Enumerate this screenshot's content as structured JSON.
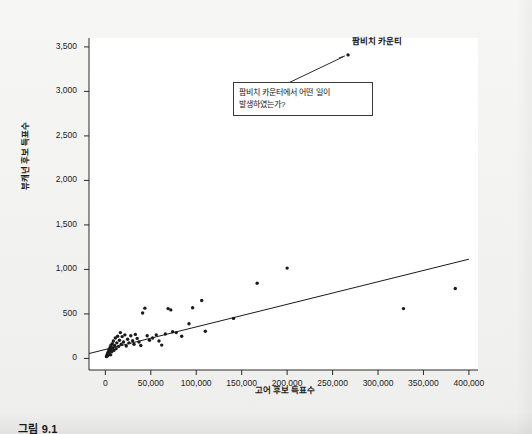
{
  "figure": {
    "caption": "그림 9.1"
  },
  "chart_data": {
    "type": "scatter",
    "title": "",
    "xlabel": "고어 후보 득표수",
    "ylabel": "뷰캐넌 후보 득표수",
    "xlim": [
      -18000,
      410000
    ],
    "ylim": [
      -130,
      3600
    ],
    "grid": false,
    "legend": "none",
    "x_ticks": [
      0,
      50000,
      100000,
      150000,
      200000,
      250000,
      300000,
      350000,
      400000
    ],
    "x_tick_labels": [
      "0",
      "50,000",
      "100,000",
      "150,000",
      "200,000",
      "250,000",
      "300,000",
      "350,000",
      "400,000"
    ],
    "y_ticks": [
      0,
      500,
      1000,
      1500,
      2000,
      2500,
      3000,
      3500
    ],
    "y_tick_labels": [
      "0",
      "500",
      "1,000",
      "1,500",
      "2,000",
      "2,500",
      "3,000",
      "3,500"
    ],
    "point_color": "#1a1a1a",
    "line_color": "#1a1a1a",
    "trend_line": {
      "name": "회귀선",
      "x0": -18000,
      "y0": 55,
      "x1": 400000,
      "y1": 1115
    },
    "points": [
      {
        "x": 1200,
        "y": 20
      },
      {
        "x": 1800,
        "y": 35
      },
      {
        "x": 2200,
        "y": 50
      },
      {
        "x": 2600,
        "y": 30
      },
      {
        "x": 3000,
        "y": 70
      },
      {
        "x": 3400,
        "y": 45
      },
      {
        "x": 3800,
        "y": 95
      },
      {
        "x": 4200,
        "y": 60
      },
      {
        "x": 4600,
        "y": 110
      },
      {
        "x": 5000,
        "y": 85
      },
      {
        "x": 5400,
        "y": 130
      },
      {
        "x": 5800,
        "y": 40
      },
      {
        "x": 6200,
        "y": 150
      },
      {
        "x": 6600,
        "y": 105
      },
      {
        "x": 7000,
        "y": 75
      },
      {
        "x": 7600,
        "y": 165
      },
      {
        "x": 8200,
        "y": 120
      },
      {
        "x": 8800,
        "y": 195
      },
      {
        "x": 9400,
        "y": 90
      },
      {
        "x": 10200,
        "y": 145
      },
      {
        "x": 11000,
        "y": 230
      },
      {
        "x": 11800,
        "y": 110
      },
      {
        "x": 12600,
        "y": 175
      },
      {
        "x": 13500,
        "y": 250
      },
      {
        "x": 14500,
        "y": 135
      },
      {
        "x": 15500,
        "y": 205
      },
      {
        "x": 16500,
        "y": 290
      },
      {
        "x": 17500,
        "y": 160
      },
      {
        "x": 18500,
        "y": 245
      },
      {
        "x": 20000,
        "y": 185
      },
      {
        "x": 21500,
        "y": 265
      },
      {
        "x": 23000,
        "y": 140
      },
      {
        "x": 24500,
        "y": 215
      },
      {
        "x": 26000,
        "y": 175
      },
      {
        "x": 28000,
        "y": 255
      },
      {
        "x": 30000,
        "y": 200
      },
      {
        "x": 31500,
        "y": 160
      },
      {
        "x": 33000,
        "y": 270
      },
      {
        "x": 35000,
        "y": 225
      },
      {
        "x": 37000,
        "y": 185
      },
      {
        "x": 39000,
        "y": 145
      },
      {
        "x": 41000,
        "y": 510
      },
      {
        "x": 43500,
        "y": 565
      },
      {
        "x": 46000,
        "y": 255
      },
      {
        "x": 48500,
        "y": 205
      },
      {
        "x": 52000,
        "y": 230
      },
      {
        "x": 56000,
        "y": 265
      },
      {
        "x": 59000,
        "y": 195
      },
      {
        "x": 62000,
        "y": 150
      },
      {
        "x": 66000,
        "y": 275
      },
      {
        "x": 69000,
        "y": 560
      },
      {
        "x": 72000,
        "y": 545
      },
      {
        "x": 74000,
        "y": 300
      },
      {
        "x": 78000,
        "y": 290
      },
      {
        "x": 84000,
        "y": 250
      },
      {
        "x": 92000,
        "y": 390
      },
      {
        "x": 96000,
        "y": 570
      },
      {
        "x": 106000,
        "y": 650
      },
      {
        "x": 110000,
        "y": 305
      },
      {
        "x": 141000,
        "y": 450
      },
      {
        "x": 167000,
        "y": 845
      },
      {
        "x": 200000,
        "y": 1015
      },
      {
        "x": 328000,
        "y": 560
      },
      {
        "x": 385000,
        "y": 785
      },
      {
        "x": 267000,
        "y": 3410
      }
    ],
    "annotations": [
      {
        "name": "outlier-label",
        "text": "팜비치 카운티",
        "points_to": {
          "x": 267000,
          "y": 3410
        }
      },
      {
        "name": "callout-question",
        "text": "팜비치 카운터에서 어떤 일이\n발생하였는가?",
        "leader_from": {
          "x": 186000,
          "y": 3020
        },
        "leader_to": {
          "x": 262000,
          "y": 3390
        }
      }
    ]
  }
}
